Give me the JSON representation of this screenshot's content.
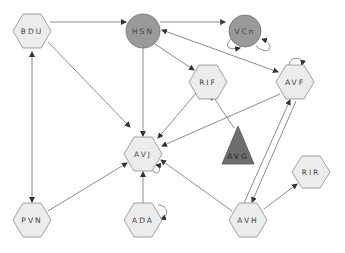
{
  "diagram": {
    "type": "network-graph",
    "colors": {
      "hexagon_fill": "#ececec",
      "circle_fill": "#9a9a9a",
      "triangle_fill": "#6e6e6e",
      "edge": "#6e6e6e",
      "label": "#444444"
    },
    "nodes": [
      {
        "id": "BDU",
        "label": "BDU",
        "shape": "hexagon",
        "x": 32,
        "y": 31
      },
      {
        "id": "HSN",
        "label": "HSN",
        "shape": "circle",
        "x": 143,
        "y": 31
      },
      {
        "id": "VCn",
        "label": "VCn",
        "shape": "circle",
        "x": 245,
        "y": 31
      },
      {
        "id": "RIF",
        "label": "RIF",
        "shape": "hexagon",
        "x": 208,
        "y": 82
      },
      {
        "id": "AVF",
        "label": "AVF",
        "shape": "hexagon",
        "x": 295,
        "y": 82
      },
      {
        "id": "AVJ",
        "label": "AVJ",
        "shape": "hexagon",
        "x": 143,
        "y": 154
      },
      {
        "id": "AVG",
        "label": "AVG",
        "shape": "triangle",
        "x": 238,
        "y": 140
      },
      {
        "id": "PVN",
        "label": "PVN",
        "shape": "hexagon",
        "x": 32,
        "y": 220
      },
      {
        "id": "ADA",
        "label": "ADA",
        "shape": "hexagon",
        "x": 143,
        "y": 220
      },
      {
        "id": "AVH",
        "label": "AVH",
        "shape": "hexagon",
        "x": 248,
        "y": 220
      },
      {
        "id": "RIR",
        "label": "RIR",
        "shape": "hexagon",
        "x": 310,
        "y": 172
      }
    ],
    "edges": [
      {
        "from": "BDU",
        "to": "HSN",
        "type": "arrow"
      },
      {
        "from": "HSN",
        "to": "VCn",
        "type": "arrow-tee"
      },
      {
        "from": "BDU",
        "to": "AVJ",
        "type": "arrow"
      },
      {
        "from": "BDU",
        "to": "PVN",
        "type": "bidirectional"
      },
      {
        "from": "HSN",
        "to": "RIF",
        "type": "arrow"
      },
      {
        "from": "HSN",
        "to": "AVJ",
        "type": "arrow"
      },
      {
        "from": "HSN",
        "to": "AVF",
        "type": "bidirectional"
      },
      {
        "from": "RIF",
        "to": "AVJ",
        "type": "arrow"
      },
      {
        "from": "AVF",
        "to": "AVJ",
        "type": "arrow"
      },
      {
        "from": "AVG",
        "to": "RIF",
        "type": "tee"
      },
      {
        "from": "PVN",
        "to": "AVJ",
        "type": "arrow"
      },
      {
        "from": "ADA",
        "to": "AVJ",
        "type": "arrow"
      },
      {
        "from": "AVH",
        "to": "AVJ",
        "type": "arrow"
      },
      {
        "from": "AVH",
        "to": "AVF",
        "type": "arrow"
      },
      {
        "from": "AVF",
        "to": "AVH",
        "type": "arrow"
      },
      {
        "from": "AVH",
        "to": "RIR",
        "type": "arrow"
      },
      {
        "from": "VCn",
        "to": "VCn",
        "type": "self-loop"
      },
      {
        "from": "AVF",
        "to": "AVF",
        "type": "self-loop"
      },
      {
        "from": "AVJ",
        "to": "AVJ",
        "type": "self-loop"
      },
      {
        "from": "ADA",
        "to": "ADA",
        "type": "self-loop"
      }
    ]
  },
  "labels": {
    "BDU": "BDU",
    "HSN": "HSN",
    "VCn": "VCn",
    "RIF": "RIF",
    "AVF": "AVF",
    "AVJ": "AVJ",
    "AVG": "AVG",
    "PVN": "PVN",
    "ADA": "ADA",
    "AVH": "AVH",
    "RIR": "RIR"
  }
}
